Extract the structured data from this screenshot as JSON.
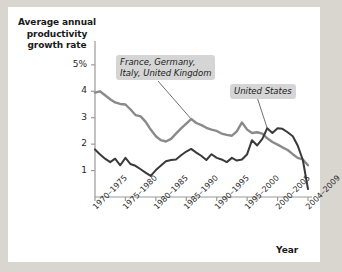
{
  "chart_data": {
    "type": "line",
    "title": "",
    "ylabel": "Average annual productivity growth rate",
    "xlabel": "Year",
    "ylim": [
      0,
      5.6
    ],
    "yticks": [
      1,
      2,
      3,
      4,
      5
    ],
    "ytick_labels": [
      "1",
      "2",
      "3",
      "4",
      "5%"
    ],
    "grid": false,
    "legend_position": "inline-annotations",
    "categories": [
      "1970–1975",
      "1975–1980",
      "1980–1985",
      "1985–1990",
      "1990–1995",
      "1995–2000",
      "2000–2005",
      "2004–2009"
    ],
    "series": [
      {
        "name": "France, Germany, Italy, United Kingdom",
        "color": "#8a8a8a",
        "x": [
          0.0,
          0.16,
          0.33,
          0.5,
          0.66,
          0.83,
          1.0,
          1.16,
          1.33,
          1.5,
          1.66,
          1.83,
          2.0,
          2.16,
          2.33,
          2.5,
          2.66,
          2.83,
          3.0,
          3.16,
          3.33,
          3.5,
          3.66,
          3.83,
          4.0,
          4.16,
          4.33,
          4.5,
          4.66,
          4.83,
          5.0,
          5.16,
          5.33,
          5.5,
          5.66,
          5.83,
          6.0,
          6.16,
          6.33,
          6.5,
          6.66,
          6.83,
          7.0
        ],
        "values": [
          3.95,
          4.0,
          3.85,
          3.7,
          3.58,
          3.52,
          3.5,
          3.32,
          3.1,
          3.05,
          2.85,
          2.55,
          2.3,
          2.15,
          2.1,
          2.2,
          2.4,
          2.6,
          2.78,
          2.95,
          2.8,
          2.72,
          2.62,
          2.55,
          2.5,
          2.4,
          2.35,
          2.32,
          2.48,
          2.82,
          2.55,
          2.42,
          2.45,
          2.4,
          2.22,
          2.08,
          1.98,
          1.88,
          1.78,
          1.62,
          1.48,
          1.42,
          1.2
        ]
      },
      {
        "name": "United States",
        "color": "#3a3a3a",
        "x": [
          0.0,
          0.16,
          0.33,
          0.5,
          0.66,
          0.83,
          1.0,
          1.16,
          1.33,
          1.5,
          1.66,
          1.83,
          2.0,
          2.16,
          2.33,
          2.5,
          2.66,
          2.83,
          3.0,
          3.16,
          3.33,
          3.5,
          3.66,
          3.83,
          4.0,
          4.16,
          4.33,
          4.5,
          4.66,
          4.83,
          5.0,
          5.16,
          5.33,
          5.5,
          5.66,
          5.83,
          6.0,
          6.16,
          6.33,
          6.5,
          6.66,
          6.83,
          7.0
        ],
        "values": [
          1.8,
          1.62,
          1.45,
          1.32,
          1.45,
          1.2,
          1.48,
          1.25,
          1.18,
          1.05,
          0.92,
          0.8,
          1.02,
          1.18,
          1.35,
          1.4,
          1.42,
          1.58,
          1.72,
          1.82,
          1.68,
          1.55,
          1.4,
          1.62,
          1.48,
          1.42,
          1.32,
          1.48,
          1.38,
          1.42,
          1.62,
          2.15,
          1.95,
          2.2,
          2.6,
          2.42,
          2.6,
          2.58,
          2.45,
          2.3,
          1.95,
          1.4,
          0.3
        ]
      }
    ],
    "annotations": [
      {
        "id": "europe-callout",
        "lines": [
          "France, Germany,",
          "Italy, United Kingdom"
        ],
        "target_x": 3.16,
        "target_y": 2.95
      },
      {
        "id": "us-callout",
        "lines": [
          "United States"
        ],
        "target_x": 5.66,
        "target_y": 2.6
      }
    ]
  },
  "axes": {
    "y_title_line1": "Average annual",
    "y_title_line2": "productivity",
    "y_title_line3": "growth rate",
    "x_title": "Year"
  }
}
